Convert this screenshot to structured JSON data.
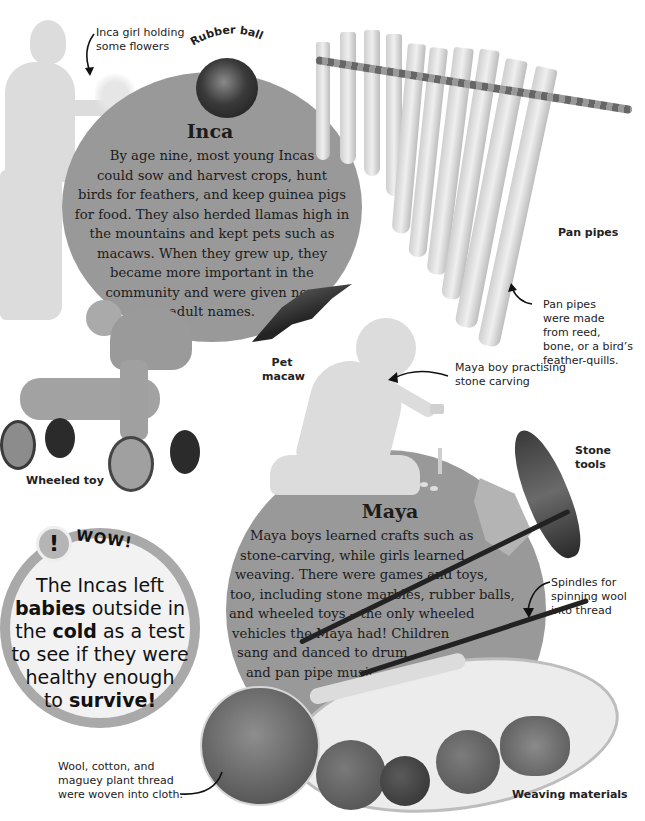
{
  "inca": {
    "heading": "Inca",
    "body_lines": [
      "By age nine, most young Incas",
      "could sow and harvest crops, hunt",
      "birds for feathers, and keep guinea pigs",
      "for food. They also herded llamas high in",
      "the mountains and kept pets such as",
      "macaws. When they grew up, they",
      "became more important in the",
      "community and were given new",
      "adult names."
    ]
  },
  "maya": {
    "heading": "Maya",
    "body_lines": [
      "Maya boys learned crafts such as",
      "stone-carving, while girls learned",
      "weaving. There were games and toys,",
      "too, including stone marbles, rubber balls,",
      "and wheeled toys – the only wheeled",
      "vehicles the Maya had! Children",
      "sang and danced to drum",
      "and pan pipe music."
    ]
  },
  "labels": {
    "inca_girl": [
      "Inca girl holding",
      "some flowers"
    ],
    "rubber_ball": "Rubber ball",
    "pan_pipes": "Pan pipes",
    "pan_pipes_note": [
      "Pan pipes",
      "were made",
      "from reed,",
      "bone, or a bird’s",
      "feather-quills."
    ],
    "pet_macaw": [
      "Pet",
      "macaw"
    ],
    "wheeled_toy": "Wheeled toy",
    "maya_boy": [
      "Maya boy practising",
      "stone carving"
    ],
    "stone_tools": [
      "Stone",
      "tools"
    ],
    "spindles": [
      "Spindles for",
      "spinning wool",
      "into thread"
    ],
    "wool_note": [
      "Wool, cotton, and",
      "maguey plant thread",
      "were woven into cloth."
    ],
    "weaving_materials": "Weaving materials"
  },
  "wow_box": {
    "badge": "!",
    "title": "WOW!",
    "line1": "The Incas left",
    "line2_bold": "babies",
    "line2_rest": " outside in",
    "line3_pre": "the ",
    "line3_bold": "cold",
    "line3_rest": " as a test",
    "line4": "to see if they were",
    "line5": "healthy enough",
    "line6_pre": "to ",
    "line6_bold": "survive!"
  },
  "colors": {
    "circle": "#999999",
    "silhouette": "#dcdcdc",
    "text": "#1c1c1c"
  }
}
